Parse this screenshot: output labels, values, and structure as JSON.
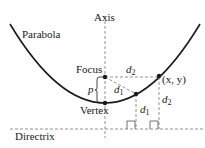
{
  "diagram": {
    "labels": {
      "parabola": "Parabola",
      "axis": "Axis",
      "focus": "Focus",
      "vertex": "Vertex",
      "directrix": "Directrix",
      "point": "(x, y)",
      "p": "p",
      "d": "d",
      "sub1": "1",
      "sub2": "2"
    },
    "points": [
      {
        "name": "Focus",
        "x": 105,
        "y": 77
      },
      {
        "name": "Vertex",
        "x": 105,
        "y": 103
      },
      {
        "name": "point-d1",
        "x": 136,
        "y": 94
      },
      {
        "name": "(x, y)",
        "x": 159,
        "y": 76
      }
    ],
    "colors": {
      "stroke": "#1a1a1a",
      "dashed": "#777777"
    }
  }
}
